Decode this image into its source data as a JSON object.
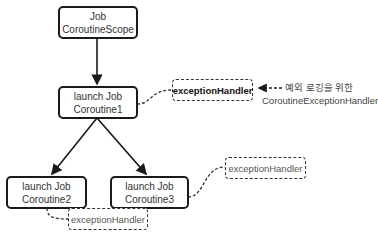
{
  "nodes": {
    "scope": {
      "line1": "Job",
      "line2": "CoroutineScope"
    },
    "coroutine1": {
      "line1": "launch Job",
      "line2": "Coroutine1"
    },
    "coroutine2": {
      "line1": "launch Job",
      "line2": "Coroutine2"
    },
    "coroutine3": {
      "line1": "launch Job",
      "line2": "Coroutine3"
    }
  },
  "handlers": {
    "h1": {
      "label": "exceptionHandler"
    },
    "h2": {
      "label": "exceptionHandler"
    },
    "h3": {
      "label": "exceptionHandler"
    }
  },
  "annotation": {
    "line1": "예외 로깅을 위한",
    "line2": "CoroutineExceptionHandler"
  },
  "colors": {
    "stroke": "#1a1a1a",
    "text": "#333333"
  }
}
